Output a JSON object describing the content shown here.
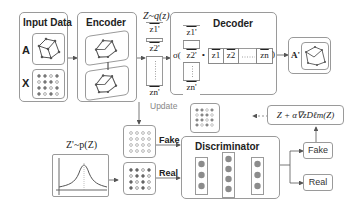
{
  "input_data": {
    "title": "Input Data",
    "label_a": "A",
    "label_x": "X"
  },
  "encoder": {
    "title": "Encoder"
  },
  "latent": {
    "title": "Z~q(z)",
    "items": [
      "z1'",
      "z2'",
      "zn'"
    ]
  },
  "decoder": {
    "title": "Decoder",
    "sigma": "σ(",
    "close": ")",
    "dot": "•",
    "col_items": [
      "z1'",
      "z2'",
      "zn'"
    ],
    "row_items": [
      "z1",
      "z2",
      "zn"
    ]
  },
  "output": {
    "label": "A'"
  },
  "update_label": "Update",
  "prior": {
    "title": "Z'~p(Z)"
  },
  "discriminator": {
    "title": "Discriminator",
    "fake_label": "Fake",
    "real_label": "Real"
  },
  "outputs": {
    "fake": "Fake",
    "real": "Real"
  },
  "formula": "Z + α∇zDℓm(Z)",
  "colors": {
    "border": "#9a9a9a",
    "node": "#8c8c8c",
    "arrow": "#555555"
  }
}
